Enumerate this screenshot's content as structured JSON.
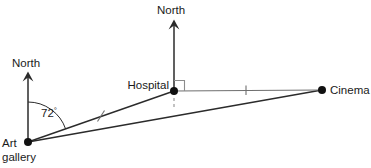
{
  "diagram": {
    "background_color": "#ffffff",
    "line_color": "#2b2b2b",
    "thin_line_color": "#8c8c8c",
    "dashed_line_color": "#9a9a9a",
    "point_color": "#111111",
    "text_color": "#1a1a1a",
    "points": [
      {
        "id": "art-gallery",
        "label_line_1": "Art",
        "label_line_2": "gallery",
        "x": 28,
        "y": 142
      },
      {
        "id": "hospital",
        "label": "Hospital",
        "x": 174,
        "y": 91
      },
      {
        "id": "cinema",
        "label": "Cinema",
        "x": 322,
        "y": 90
      }
    ],
    "north_arrows": [
      {
        "id": "north-art-gallery",
        "label": "North",
        "base_x": 28,
        "base_y": 142,
        "tip_x": 28,
        "tip_y": 72,
        "label_x": 12,
        "label_y": 66
      },
      {
        "id": "north-hospital",
        "label": "North",
        "base_x": 174,
        "base_y": 91,
        "tip_x": 174,
        "tip_y": 20,
        "label_x": 157,
        "label_y": 13
      }
    ],
    "segments": [
      {
        "id": "art-gallery-to-hospital",
        "from": "art-gallery",
        "to": "hospital",
        "tick_marks": 1
      },
      {
        "id": "hospital-to-cinema",
        "from": "hospital",
        "to": "cinema",
        "tick_marks": 1
      },
      {
        "id": "art-gallery-to-cinema",
        "from": "art-gallery",
        "to": "cinema",
        "tick_marks": 0
      }
    ],
    "angle": {
      "id": "bearing-angle-at-art-gallery",
      "value": "72",
      "degree_symbol": "°",
      "vertex": "art-gallery",
      "from_ray": "north-art-gallery",
      "to_ray": "art-gallery-to-hospital",
      "label_x": 41,
      "label_y": 117
    },
    "right_angle": {
      "id": "right-angle-at-hospital",
      "vertex": "hospital",
      "between": [
        "north-hospital",
        "hospital-to-cinema"
      ],
      "size": 10
    },
    "dashed_drop": {
      "id": "hospital-perpendicular-drop",
      "from_x": 174,
      "from_y": 91,
      "to_x": 174,
      "to_y": 109
    }
  }
}
